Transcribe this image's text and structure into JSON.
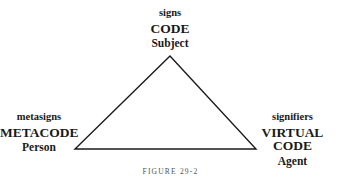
{
  "nodes": {
    "top": {
      "line1": "signs",
      "line2": "CODE",
      "line3": "Subject"
    },
    "left": {
      "line1": "metasigns",
      "line2": "METACODE",
      "line3": "Person"
    },
    "right": {
      "line1": "signifiers",
      "line2": "VIRTUAL CODE",
      "line3": "Agent"
    }
  },
  "caption": "FIGURE 29-2",
  "colors": {
    "line": "#1a1a1a",
    "text": "#1a1a1a"
  }
}
